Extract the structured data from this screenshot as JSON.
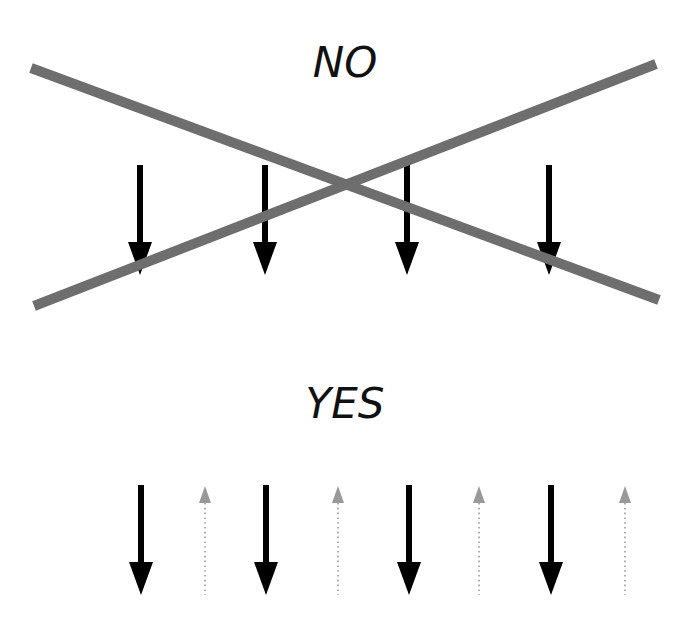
{
  "diagram": {
    "canvas": {
      "width": 698,
      "height": 628,
      "background": "#ffffff"
    },
    "panels": [
      {
        "id": "no",
        "label": "NO",
        "label_pos": {
          "x": 345,
          "y": 77
        },
        "arrows": [
          {
            "x": 140,
            "y1": 165,
            "y2": 275,
            "direction": "down",
            "style": "solid",
            "color": "#000000"
          },
          {
            "x": 265,
            "y1": 165,
            "y2": 275,
            "direction": "down",
            "style": "solid",
            "color": "#000000"
          },
          {
            "x": 407,
            "y1": 165,
            "y2": 275,
            "direction": "down",
            "style": "solid",
            "color": "#000000"
          },
          {
            "x": 549,
            "y1": 165,
            "y2": 275,
            "direction": "down",
            "style": "solid",
            "color": "#000000"
          }
        ],
        "cross_out": {
          "color": "#6e6e6e",
          "width": 10,
          "lines": [
            {
              "x1": 31,
              "y1": 68,
              "x2": 659,
              "y2": 300
            },
            {
              "x1": 34,
              "y1": 306,
              "x2": 656,
              "y2": 64
            }
          ]
        }
      },
      {
        "id": "yes",
        "label": "YES",
        "label_pos": {
          "x": 345,
          "y": 418
        },
        "arrows": [
          {
            "x": 141,
            "y1": 485,
            "y2": 595,
            "direction": "down",
            "style": "solid",
            "color": "#000000"
          },
          {
            "x": 205,
            "y1": 486,
            "y2": 595,
            "direction": "up",
            "style": "dotted",
            "color": "#999999"
          },
          {
            "x": 266,
            "y1": 485,
            "y2": 595,
            "direction": "down",
            "style": "solid",
            "color": "#000000"
          },
          {
            "x": 338,
            "y1": 486,
            "y2": 595,
            "direction": "up",
            "style": "dotted",
            "color": "#999999"
          },
          {
            "x": 409,
            "y1": 485,
            "y2": 595,
            "direction": "down",
            "style": "solid",
            "color": "#000000"
          },
          {
            "x": 479,
            "y1": 486,
            "y2": 595,
            "direction": "up",
            "style": "dotted",
            "color": "#999999"
          },
          {
            "x": 551,
            "y1": 485,
            "y2": 595,
            "direction": "down",
            "style": "solid",
            "color": "#000000"
          },
          {
            "x": 625,
            "y1": 486,
            "y2": 595,
            "direction": "up",
            "style": "dotted",
            "color": "#999999"
          }
        ]
      }
    ]
  }
}
